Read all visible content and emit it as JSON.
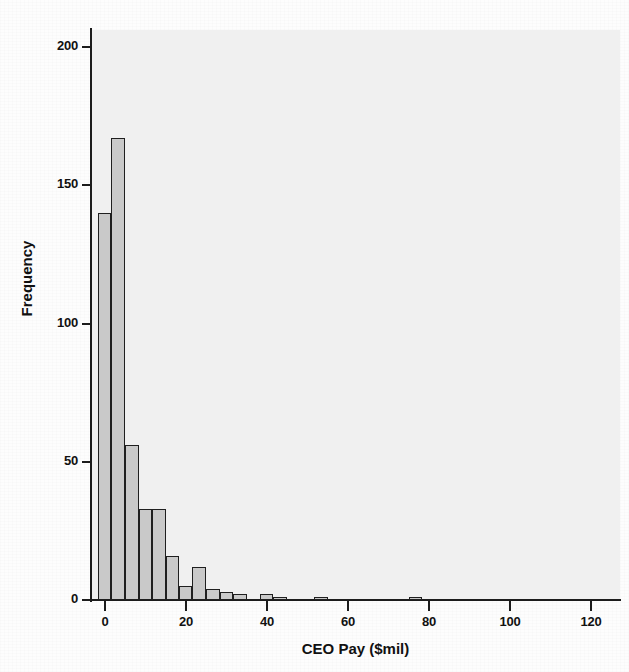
{
  "chart_data": {
    "type": "bar",
    "title": "",
    "xlabel": "CEO Pay ($mil)",
    "ylabel": "Frequency",
    "xlim": [
      -2,
      127
    ],
    "ylim": [
      0,
      205
    ],
    "xticks": [
      0,
      20,
      40,
      60,
      80,
      100,
      120
    ],
    "xtick_labels": [
      "0",
      "20",
      "40",
      "60",
      "80",
      "100",
      "120"
    ],
    "yticks": [
      0,
      50,
      100,
      150,
      200
    ],
    "ytick_labels": [
      "0",
      "50",
      "100",
      "150",
      "200"
    ],
    "grid": false,
    "legend": false,
    "bin_width": 3.33,
    "bar_fill": "#c9c9c9",
    "bar_edge": "#1f1f1f",
    "plot_background": "#f0f0f0",
    "bins": [
      {
        "x0": -1.7,
        "x1": 1.6,
        "value": 140
      },
      {
        "x0": 1.6,
        "x1": 5.0,
        "value": 167
      },
      {
        "x0": 5.0,
        "x1": 8.3,
        "value": 56
      },
      {
        "x0": 8.3,
        "x1": 11.6,
        "value": 33
      },
      {
        "x0": 11.6,
        "x1": 15.0,
        "value": 33
      },
      {
        "x0": 15.0,
        "x1": 18.3,
        "value": 16
      },
      {
        "x0": 18.3,
        "x1": 21.6,
        "value": 5
      },
      {
        "x0": 21.6,
        "x1": 25.0,
        "value": 12
      },
      {
        "x0": 25.0,
        "x1": 28.3,
        "value": 4
      },
      {
        "x0": 28.3,
        "x1": 31.6,
        "value": 3
      },
      {
        "x0": 31.6,
        "x1": 35.0,
        "value": 2
      },
      {
        "x0": 38.3,
        "x1": 41.6,
        "value": 2
      },
      {
        "x0": 41.6,
        "x1": 45.0,
        "value": 1
      },
      {
        "x0": 51.6,
        "x1": 55.0,
        "value": 1
      },
      {
        "x0": 75.0,
        "x1": 78.3,
        "value": 1
      }
    ]
  },
  "chart": {
    "xlabel": "CEO Pay ($mil)",
    "ylabel": "Frequency"
  }
}
